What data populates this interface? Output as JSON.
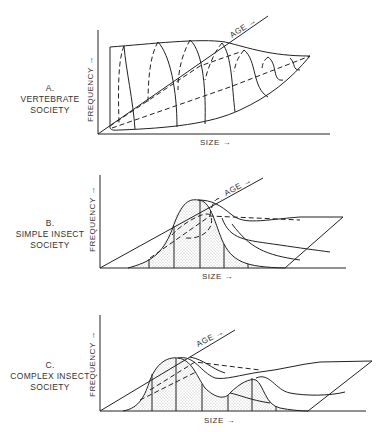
{
  "panels": [
    {
      "id": "A",
      "letter": "A.",
      "title_line1": "VERTEBRATE",
      "title_line2": "SOCIETY",
      "y_axis_label": "FREQUENCY",
      "x_axis_label": "SIZE",
      "depth_axis_label": "AGE",
      "arrow": "→"
    },
    {
      "id": "B",
      "letter": "B.",
      "title_line1": "SIMPLE INSECT",
      "title_line2": "SOCIETY",
      "y_axis_label": "FREQUENCY",
      "x_axis_label": "SIZE",
      "depth_axis_label": "AGE",
      "arrow": "→"
    },
    {
      "id": "C",
      "letter": "C.",
      "title_line1": "COMPLEX INSECT",
      "title_line2": "SOCIETY",
      "y_axis_label": "FREQUENCY",
      "x_axis_label": "SIZE",
      "depth_axis_label": "AGE",
      "arrow": "→"
    }
  ],
  "colors": {
    "line": "#222222",
    "stipple": "#9a9a9a",
    "background": "#ffffff"
  }
}
